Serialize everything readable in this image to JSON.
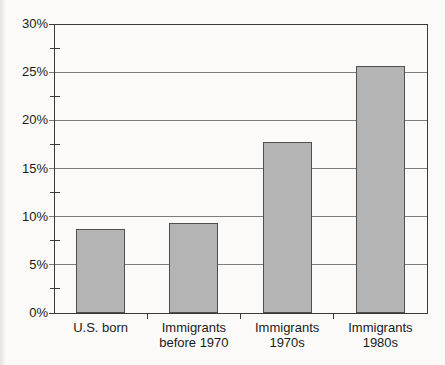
{
  "chart_data": {
    "type": "bar",
    "title": "",
    "categories": [
      "U.S. born",
      "Immigrants before 1970",
      "Immigrants 1970s",
      "Immigrants 1980s"
    ],
    "category_label_lines": [
      [
        "U.S. born"
      ],
      [
        "Immigrants",
        "before 1970"
      ],
      [
        "Immigrants",
        "1970s"
      ],
      [
        "Immigrants",
        "1980s"
      ]
    ],
    "values": [
      8.7,
      9.3,
      17.7,
      25.6
    ],
    "unit": "%",
    "xlabel": "",
    "ylabel": "",
    "ylim": [
      0,
      30
    ],
    "y_major_step": 5,
    "y_minor_step": 2.5,
    "y_tick_labels": [
      "0%",
      "5%",
      "10%",
      "15%",
      "20%",
      "25%",
      "30%"
    ],
    "gridlines": "horizontal-major",
    "legend": "none",
    "colors": {
      "bar_fill": "#b4b4b4",
      "bar_border": "#4f4f4f",
      "axis": "#3a3a3a",
      "gridline": "#7d7d7d",
      "text": "#1a1a1a",
      "background": "#fbfaf8"
    }
  }
}
